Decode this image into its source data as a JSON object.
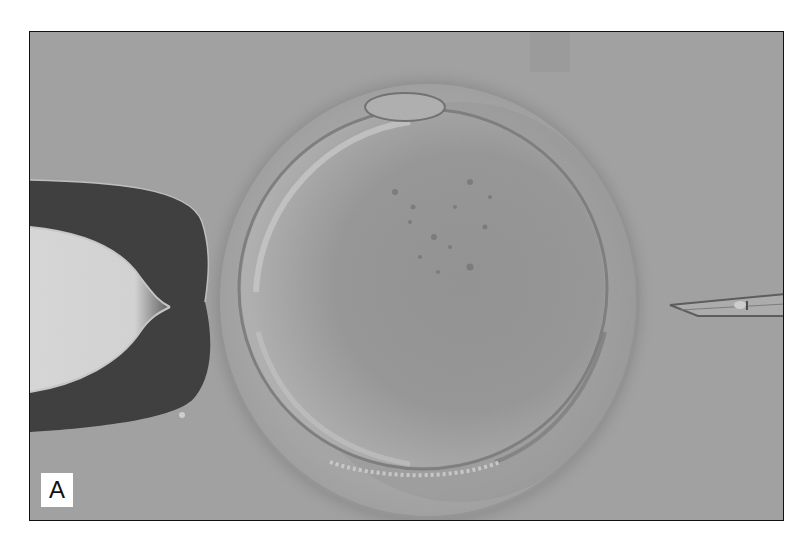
{
  "figure": {
    "panel_label": "A",
    "elements": {
      "left_instrument": "holding-pipette",
      "center_object": "oocyte with zona pellucida",
      "right_instrument": "injection-micropipette"
    },
    "colors": {
      "background": "#a3a3a3",
      "frame_border": "#111111",
      "pipette_dark": "#0d0d0d",
      "pipette_lumen": "#f2f2f2",
      "label_bg": "#ffffff"
    }
  }
}
